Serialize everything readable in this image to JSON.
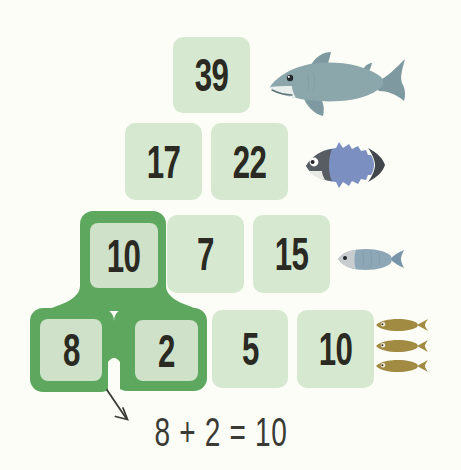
{
  "page": {
    "type": "addition-pyramid-worksheet",
    "background": "#fcfdf7"
  },
  "colors": {
    "tile_fill": "#d6e9d0",
    "highlight_green": "#5ea75e",
    "highlight_inner_fill": "#d0e1c9",
    "number_color": "#2a2a23",
    "annotation_color": "#3b3b36",
    "shark_body": "#8ba7ab",
    "tuna_body": "#7b8fc0",
    "sardine_body": "#8ea7b6",
    "anchovy_body": "#a18a42"
  },
  "pyramid": {
    "rows": [
      {
        "level": 1,
        "tiles": [
          {
            "value": "39",
            "highlighted": false
          }
        ],
        "fish": "shark",
        "fish_count": 1
      },
      {
        "level": 2,
        "tiles": [
          {
            "value": "17",
            "highlighted": false
          },
          {
            "value": "22",
            "highlighted": false
          }
        ],
        "fish": "tuna",
        "fish_count": 1
      },
      {
        "level": 3,
        "tiles": [
          {
            "value": "10",
            "highlighted": true
          },
          {
            "value": "7",
            "highlighted": false
          },
          {
            "value": "15",
            "highlighted": false
          }
        ],
        "fish": "sardine",
        "fish_count": 1
      },
      {
        "level": 4,
        "tiles": [
          {
            "value": "8",
            "highlighted": true
          },
          {
            "value": "2",
            "highlighted": true
          },
          {
            "value": "5",
            "highlighted": false
          },
          {
            "value": "10",
            "highlighted": false
          }
        ],
        "fish": "anchovy",
        "fish_count": 3
      }
    ]
  },
  "annotation": {
    "equation": "8 + 2 = 10"
  }
}
